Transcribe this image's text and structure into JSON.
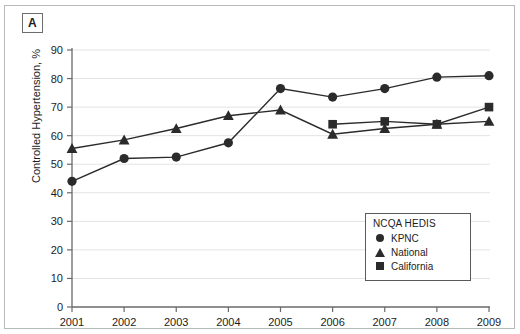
{
  "panel": {
    "label": "A"
  },
  "legend": {
    "title": "NCQA HEDIS",
    "entries": [
      {
        "label": "KPNC",
        "marker": "circle-marker-icon"
      },
      {
        "label": "National",
        "marker": "triangle-marker-icon"
      },
      {
        "label": "California",
        "marker": "square-marker-icon"
      }
    ]
  },
  "chart_data": {
    "type": "line",
    "title": "",
    "xlabel": "",
    "ylabel": "Controlled Hypertension, %",
    "x": [
      2001,
      2002,
      2003,
      2004,
      2005,
      2006,
      2007,
      2008,
      2009
    ],
    "xticklabels": [
      "2001",
      "2002",
      "2003",
      "2004",
      "2005",
      "2006",
      "2007",
      "2008",
      "2009"
    ],
    "yticks": [
      0,
      10,
      20,
      30,
      40,
      50,
      60,
      70,
      80,
      90
    ],
    "yticklabels": [
      "0",
      "10",
      "20",
      "30",
      "40",
      "50",
      "60",
      "70",
      "80",
      "90"
    ],
    "ylim": [
      0,
      90
    ],
    "xlim": [
      2000.6,
      2009.4
    ],
    "grid": "horizontal",
    "legend_position": "lower-right",
    "series": [
      {
        "name": "KPNC",
        "marker": "circle",
        "color": "#2b2b2b",
        "values": [
          44,
          52,
          52.5,
          57.5,
          76.5,
          73.5,
          76.5,
          80.5,
          81
        ]
      },
      {
        "name": "National",
        "marker": "triangle",
        "color": "#2b2b2b",
        "values": [
          55.5,
          58.5,
          62.5,
          67,
          69,
          60.5,
          62.5,
          64,
          65
        ]
      },
      {
        "name": "California",
        "marker": "square",
        "color": "#2b2b2b",
        "values": [
          null,
          null,
          null,
          null,
          null,
          64,
          65,
          64,
          70
        ]
      }
    ]
  }
}
